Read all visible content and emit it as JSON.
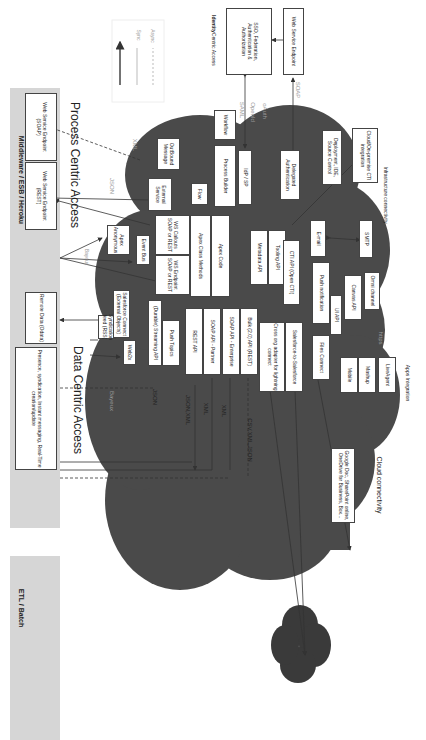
{
  "bands": {
    "middleware": "Middleware / ESB / Heroku",
    "etl": "ETL / Batch"
  },
  "middleware_boxes": [
    "Presence, syndication, Instant messaging, Real-Time creation/update",
    "Remote Data (Odata)",
    "Web Service Endpoint (REST)",
    "Web Service Endpoint (SOAP)"
  ],
  "legend": {
    "sync": "Sync",
    "async": "Async"
  },
  "identity": {
    "title_bold": "Identity",
    "title_rest": " Centric Access",
    "sso": "SSO, Federation, Authentication & Authorization",
    "ws_endpoint": "Web Service Endpoint"
  },
  "sections": {
    "data_centric": "Data Centric Access",
    "process_centric": "Process Centric Access",
    "infrastructure": "Infrastructure connectivity",
    "infrastructure_bold": "Infrastructure",
    "apps": "Apps Integration",
    "apps_bold": "Apps",
    "cloud": "Cloud connectivity",
    "cloud_bold": "Cloud"
  },
  "protocols": {
    "xml_top": "XML",
    "json_top": "JSON",
    "saml": "SAML",
    "openid": "OpenId",
    "oauth": "oAuth",
    "soap": "SOAP",
    "bayeux_mid": "Bayeux",
    "bayeux": "Bayeux",
    "json": "JSON",
    "json_xml": "JSON,XML",
    "xml1": "XML",
    "xml2": "XML",
    "csv": "CSV,XML,JSON",
    "https": "https"
  },
  "cloud_boxes": {
    "workflow": "Workflow",
    "outbound": "OutBound Message",
    "process_builder": "Process Builder",
    "idp": "IdP / SP",
    "delegated": "Delegated Authentication",
    "deployment": "Deployment, IDE, Source Control",
    "cti_int": "Cloud/On-premise CTI integration",
    "external_service": "External Service",
    "flow": "Flow",
    "apex_anon": "Apex Anonymous",
    "event_bus": "Event Bus",
    "ws_callouts": "WS Callouts SOAP or REST",
    "ws_endpoint": "WS Endpoint SOAP or REST",
    "apex_class": "Apex Class Methods",
    "apex_code": "Apex Code",
    "metadata": "Metadata API",
    "tooling": "Tooling API",
    "email": "E-mail",
    "smtp": "SMTP",
    "cti_api": "CTI API (Open CTI)",
    "push_notif": "Push notification",
    "ui_api": "UI API",
    "canvas": "Canvas API",
    "omni": "Omni channel",
    "syndication": "Syndication feed (RSS)",
    "sf_connect": "Salesforce Connect (External Objects)",
    "web2x": "Web2x",
    "streaming": "(Durable) Streaming API",
    "push_topics": "Push Topics",
    "rest": "REST API",
    "soap_partner": "SOAP API - Partner",
    "soap_enterprise": "SOAP API - Enterprise",
    "bulk": "Bulk (2.0) API (REST)",
    "cross_org": "Cross org adapter for lightning connect",
    "s2s": "Salesforce-to-Salesforce",
    "files": "Files Connect"
  },
  "apps_boxes": [
    "Mobile",
    "Mashup",
    "LiveAgent"
  ],
  "cloud_conn_box": "Google Doc, SharePoint online, OneDrive for Business, Box..."
}
